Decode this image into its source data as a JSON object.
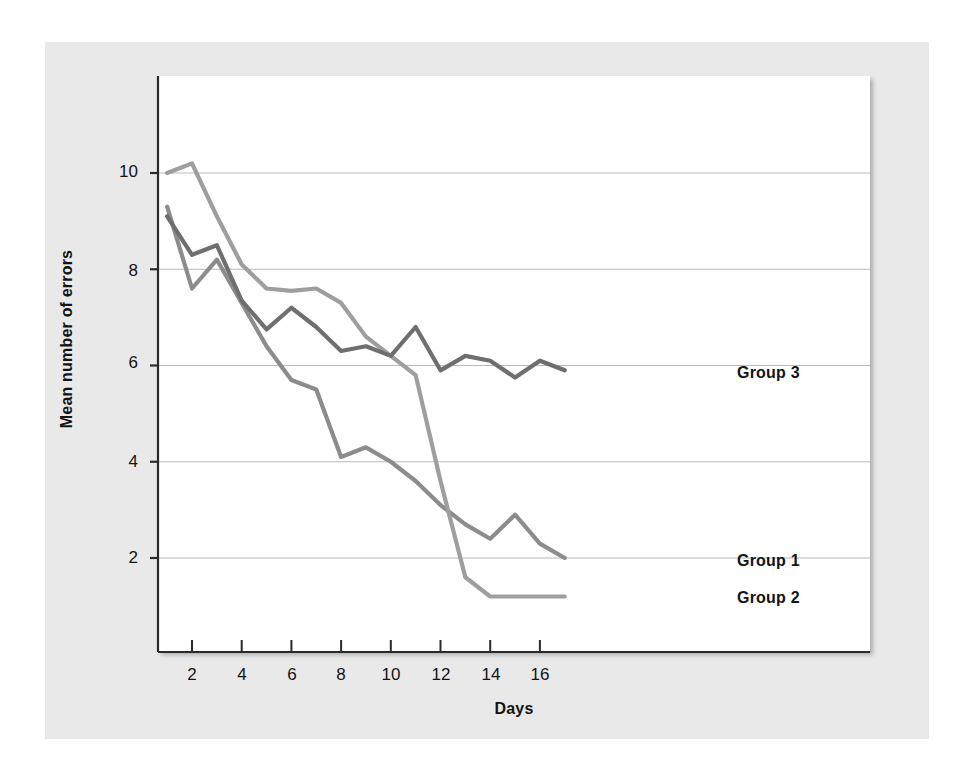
{
  "figure": {
    "background": "#ffffff",
    "mat_color": "#e9e9e9",
    "plot_background": "#ffffff"
  },
  "chart_data": {
    "type": "line",
    "title": "",
    "xlabel": "Days",
    "ylabel": "Mean number of errors",
    "xlim": [
      0.4,
      17.6
    ],
    "ylim": [
      0.3,
      11.6
    ],
    "xticks": [
      2,
      4,
      6,
      8,
      10,
      12,
      14,
      16
    ],
    "yticks": [
      2,
      4,
      6,
      8,
      10
    ],
    "grid": "horizontal",
    "grid_color": "#b9b9b9",
    "legend_position": "right-inline-end-of-line",
    "x": [
      1,
      2,
      3,
      4,
      5,
      6,
      7,
      8,
      9,
      10,
      11,
      12,
      13,
      14,
      15,
      16,
      17
    ],
    "series": [
      {
        "name": "Group 1",
        "color": "#8c8c8c",
        "values": [
          9.3,
          7.6,
          8.2,
          7.3,
          6.4,
          5.7,
          5.5,
          4.1,
          4.3,
          4.0,
          3.6,
          3.1,
          2.7,
          2.4,
          2.9,
          2.3,
          2.0
        ]
      },
      {
        "name": "Group 2",
        "color": "#9e9e9e",
        "values": [
          10.0,
          10.2,
          9.1,
          8.1,
          7.6,
          7.55,
          7.6,
          7.3,
          6.6,
          6.2,
          5.8,
          3.6,
          1.6,
          1.2,
          1.2,
          1.2,
          1.2
        ]
      },
      {
        "name": "Group 3",
        "color": "#6f6f6f",
        "values": [
          9.1,
          8.3,
          8.5,
          7.35,
          6.75,
          7.2,
          6.8,
          6.3,
          6.4,
          6.2,
          6.8,
          5.9,
          6.2,
          6.1,
          5.75,
          6.1,
          5.9
        ]
      }
    ]
  },
  "labels": {
    "ylabel": "Mean number of errors",
    "xlabel": "Days",
    "ytick_2": "2",
    "ytick_4": "4",
    "ytick_6": "6",
    "ytick_8": "8",
    "ytick_10": "10",
    "xtick_2": "2",
    "xtick_4": "4",
    "xtick_6": "6",
    "xtick_8": "8",
    "xtick_10": "10",
    "xtick_12": "12",
    "xtick_14": "14",
    "xtick_16": "16",
    "series_1": "Group 1",
    "series_2": "Group 2",
    "series_3": "Group 3"
  }
}
